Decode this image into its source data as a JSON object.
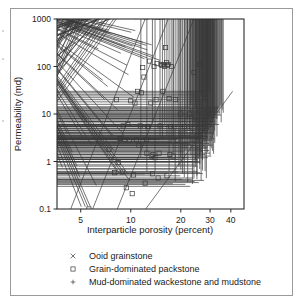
{
  "figure": {
    "background": "#ffffff",
    "frame_color": "#9a9a9a",
    "axis_color": "#2b2b2b",
    "marker_color": "#3a3a3a",
    "line_color": "#4a4a4a"
  },
  "chart_data": {
    "type": "scatter",
    "title": "",
    "subtitle": "",
    "xlabel": "Interparticle porosity (percent)",
    "ylabel": "Permeability (md)",
    "xscale": "log",
    "yscale": "log",
    "xlim": [
      3.6,
      48
    ],
    "ylim": [
      0.1,
      1000
    ],
    "xticks": [
      5,
      10,
      20,
      30,
      40
    ],
    "xticklabels": [
      "5",
      "10",
      "20",
      "30",
      "40"
    ],
    "yticks": [
      0.1,
      1,
      10,
      100,
      1000
    ],
    "yticklabels": [
      "0.1",
      "1",
      "10",
      "100",
      "1000"
    ],
    "grid": false,
    "legend_position": "below-axes",
    "legend": [
      {
        "marker": "x",
        "label": "Ooid grainstone"
      },
      {
        "marker": "square",
        "label": "Grain-dominated packstone"
      },
      {
        "marker": "plus",
        "label": "Mud-dominated wackestone and mudstone"
      }
    ],
    "series": [
      {
        "name": "Ooid grainstone",
        "marker": "x",
        "points": [
          [
            4.0,
            0.67
          ],
          [
            4.3,
            3.4
          ],
          [
            4.6,
            1.4
          ],
          [
            4.9,
            0.72
          ],
          [
            5.0,
            0.5
          ],
          [
            5.1,
            0.42
          ],
          [
            5.2,
            0.1
          ],
          [
            5.5,
            0.1
          ],
          [
            5.7,
            0.1
          ],
          [
            5.9,
            0.1
          ],
          [
            5.4,
            2.6
          ],
          [
            5.6,
            6.0
          ],
          [
            6.0,
            2.0
          ],
          [
            6.4,
            0.28
          ],
          [
            6.6,
            210
          ],
          [
            6.9,
            2.4
          ],
          [
            7.0,
            46
          ],
          [
            7.2,
            18
          ],
          [
            7.4,
            500
          ],
          [
            7.6,
            520
          ],
          [
            7.8,
            440
          ],
          [
            7.5,
            34
          ],
          [
            8.0,
            3.0
          ],
          [
            8.1,
            3.1
          ],
          [
            8.2,
            1.5
          ],
          [
            8.4,
            0.6
          ],
          [
            8.6,
            11
          ],
          [
            8.8,
            0.52
          ],
          [
            9.0,
            170
          ],
          [
            9.2,
            0.49
          ],
          [
            9.4,
            3.3
          ],
          [
            9.6,
            230
          ],
          [
            9.8,
            95
          ],
          [
            9.9,
            0.5
          ],
          [
            10.0,
            60
          ],
          [
            10.2,
            0.35
          ],
          [
            10.4,
            470
          ],
          [
            10.6,
            240
          ],
          [
            10.8,
            20
          ],
          [
            11.0,
            510
          ],
          [
            11.2,
            900
          ],
          [
            11.5,
            1000
          ],
          [
            11.8,
            1000
          ],
          [
            12.0,
            240
          ],
          [
            12.2,
            290
          ],
          [
            12.4,
            950
          ],
          [
            12.6,
            900
          ],
          [
            12.8,
            250
          ],
          [
            13.0,
            200
          ],
          [
            13.2,
            880
          ],
          [
            13.5,
            950
          ],
          [
            13.8,
            255
          ],
          [
            14.0,
            1000
          ],
          [
            14.2,
            900
          ],
          [
            14.5,
            950
          ],
          [
            15.0,
            900
          ],
          [
            15.5,
            870
          ],
          [
            16.0,
            900
          ],
          [
            16.5,
            880
          ],
          [
            12.5,
            130
          ],
          [
            13.0,
            135
          ],
          [
            14.0,
            150
          ],
          [
            15.5,
            120
          ]
        ]
      },
      {
        "name": "Grain-dominated packstone",
        "marker": "square",
        "points": [
          [
            5.6,
            0.1
          ],
          [
            7.4,
            1.8
          ],
          [
            8.0,
            0.58
          ],
          [
            8.2,
            20
          ],
          [
            8.4,
            0.95
          ],
          [
            8.6,
            3.0
          ],
          [
            8.7,
            3.1
          ],
          [
            8.9,
            0.6
          ],
          [
            9.0,
            5.6
          ],
          [
            9.2,
            2.9
          ],
          [
            9.4,
            0.28
          ],
          [
            9.6,
            6.0
          ],
          [
            9.8,
            2.8
          ],
          [
            10.0,
            19
          ],
          [
            10.2,
            0.21
          ],
          [
            10.4,
            0.52
          ],
          [
            10.6,
            17
          ],
          [
            10.8,
            2.9
          ],
          [
            11.0,
            30
          ],
          [
            11.2,
            2.2
          ],
          [
            11.4,
            5.6
          ],
          [
            11.6,
            28
          ],
          [
            11.8,
            95
          ],
          [
            12.0,
            60
          ],
          [
            12.2,
            0.35
          ],
          [
            12.4,
            2.9
          ],
          [
            12.6,
            5.4
          ],
          [
            12.8,
            5.5
          ],
          [
            13.0,
            130
          ],
          [
            13.2,
            17
          ],
          [
            13.4,
            1.3
          ],
          [
            13.6,
            1.4
          ],
          [
            13.8,
            100
          ],
          [
            14.0,
            1.2
          ],
          [
            14.2,
            20
          ],
          [
            14.4,
            115
          ],
          [
            14.6,
            0.45
          ],
          [
            14.8,
            1.5
          ],
          [
            15.0,
            5.6
          ],
          [
            15.2,
            110
          ],
          [
            15.4,
            105
          ],
          [
            15.6,
            30
          ],
          [
            15.8,
            110
          ],
          [
            16.0,
            100
          ],
          [
            16.2,
            250
          ],
          [
            16.4,
            120
          ],
          [
            16.6,
            105
          ],
          [
            16.8,
            110
          ],
          [
            17.0,
            21
          ],
          [
            17.2,
            1.4
          ],
          [
            17.4,
            5.5
          ],
          [
            17.6,
            100
          ],
          [
            18.0,
            1.3
          ],
          [
            18.4,
            5.4
          ],
          [
            18.6,
            20
          ],
          [
            19.0,
            2.8
          ],
          [
            20.0,
            10
          ],
          [
            21.0,
            5.4
          ],
          [
            22.5,
            10
          ],
          [
            24.0,
            75
          ],
          [
            26.0,
            110
          ],
          [
            12.5,
            1.5
          ],
          [
            13.5,
            0.55
          ],
          [
            16.5,
            0.5
          ]
        ]
      },
      {
        "name": "Mud-dominated wackestone and mudstone",
        "marker": "plus",
        "points": [
          [
            11.5,
            1.1
          ],
          [
            12.5,
            0.55
          ],
          [
            13.5,
            5.6
          ],
          [
            14.0,
            0.55
          ],
          [
            15.0,
            3.0
          ],
          [
            15.5,
            2.9
          ],
          [
            16.0,
            5.5
          ],
          [
            16.5,
            3.0
          ],
          [
            17.0,
            0.55
          ],
          [
            17.5,
            2.2
          ],
          [
            18.0,
            1.2
          ],
          [
            18.5,
            0.34
          ],
          [
            19.0,
            5.4
          ],
          [
            19.5,
            2.9
          ],
          [
            20.0,
            1.1
          ],
          [
            20.5,
            0.5
          ],
          [
            21.0,
            3.0
          ],
          [
            21.5,
            5.5
          ],
          [
            22.0,
            0.33
          ],
          [
            22.5,
            2.0
          ],
          [
            23.0,
            1.2
          ],
          [
            23.5,
            0.3
          ],
          [
            24.0,
            6.0
          ],
          [
            24.5,
            1.0
          ],
          [
            25.0,
            0.45
          ],
          [
            25.5,
            2.2
          ],
          [
            26.0,
            1.1
          ],
          [
            26.5,
            3.0
          ],
          [
            27.0,
            0.95
          ],
          [
            27.5,
            2.5
          ],
          [
            22.0,
            7.0
          ],
          [
            23.0,
            10
          ],
          [
            24.0,
            5.0
          ],
          [
            25.0,
            4.5
          ],
          [
            26.0,
            5.5
          ],
          [
            26.5,
            8.0
          ],
          [
            27.0,
            6.0
          ],
          [
            27.5,
            4.0
          ],
          [
            28.0,
            3.2
          ],
          [
            28.5,
            3.0
          ],
          [
            29.0,
            3.5
          ],
          [
            29.5,
            4.0
          ],
          [
            30.0,
            4.5
          ],
          [
            30.5,
            5.0
          ],
          [
            31.0,
            6.0
          ],
          [
            31.5,
            7.0
          ],
          [
            32.0,
            8.0
          ],
          [
            32.5,
            9.0
          ],
          [
            33.0,
            10
          ],
          [
            33.5,
            11
          ],
          [
            34.0,
            12
          ],
          [
            34.5,
            13
          ],
          [
            35.0,
            14
          ],
          [
            28.0,
            2.5
          ],
          [
            28.5,
            2.2
          ],
          [
            29.0,
            2.6
          ],
          [
            29.5,
            3.1
          ],
          [
            30.0,
            3.4
          ],
          [
            27.0,
            2.0
          ],
          [
            27.5,
            1.8
          ],
          [
            28.0,
            1.6
          ],
          [
            26.5,
            1.4
          ],
          [
            26.0,
            1.2
          ],
          [
            25.5,
            1.0
          ],
          [
            25.0,
            0.85
          ],
          [
            24.5,
            0.7
          ],
          [
            26.0,
            0.62
          ],
          [
            27.0,
            0.58
          ],
          [
            28.0,
            0.56
          ],
          [
            24.0,
            0.42
          ],
          [
            25.0,
            0.38
          ],
          [
            26.5,
            0.36
          ],
          [
            28.5,
            0.4
          ],
          [
            29.5,
            1.9
          ],
          [
            30.5,
            2.4
          ],
          [
            31.0,
            2.8
          ],
          [
            31.5,
            3.3
          ],
          [
            32.0,
            4.0
          ],
          [
            26.0,
            26
          ],
          [
            26.5,
            22
          ],
          [
            27.5,
            18
          ],
          [
            28.0,
            16
          ],
          [
            24.5,
            12
          ],
          [
            25.0,
            9.0
          ],
          [
            29.0,
            20
          ],
          [
            30.0,
            24
          ],
          [
            33.0,
            7.0
          ],
          [
            34.0,
            8.5
          ],
          [
            35.5,
            11
          ],
          [
            36.0,
            9.5
          ],
          [
            23.5,
            3.5
          ],
          [
            22.5,
            4.2
          ],
          [
            21.5,
            1.6
          ],
          [
            20.0,
            0.6
          ],
          [
            21.0,
            0.42
          ],
          [
            19.5,
            0.7
          ],
          [
            18.0,
            2.6
          ],
          [
            29.0,
            5.5
          ],
          [
            29.5,
            6.5
          ],
          [
            30.0,
            2.0
          ],
          [
            30.5,
            1.7
          ],
          [
            31.0,
            1.5
          ],
          [
            28.0,
            4.8
          ],
          [
            28.5,
            5.6
          ],
          [
            29.0,
            7.5
          ],
          [
            27.0,
            3.8
          ],
          [
            27.5,
            3.4
          ],
          [
            26.0,
            3.6
          ],
          [
            25.5,
            3.2
          ],
          [
            25.0,
            2.6
          ],
          [
            24.0,
            2.3
          ],
          [
            23.0,
            2.4
          ],
          [
            32.0,
            2.2
          ],
          [
            33.0,
            3.0
          ],
          [
            30.0,
            8.0
          ],
          [
            31.0,
            10
          ],
          [
            32.5,
            5.5
          ],
          [
            29.0,
            1.4
          ],
          [
            30.0,
            1.2
          ],
          [
            31.5,
            1.3
          ],
          [
            22.0,
            12
          ],
          [
            23.0,
            14
          ],
          [
            28.5,
            28
          ],
          [
            29.5,
            30
          ],
          [
            27.0,
            1.0
          ],
          [
            26.0,
            0.8
          ],
          [
            35.0,
            6.0
          ]
        ]
      }
    ],
    "trend_lines": [
      {
        "name": "trend-line-1",
        "x1": 4.35,
        "y1": 0.1,
        "x2": 12.2,
        "y2": 1000
      },
      {
        "name": "trend-line-2",
        "x1": 5.9,
        "y1": 0.1,
        "x2": 16.8,
        "y2": 1000
      },
      {
        "name": "trend-line-3",
        "x1": 8.3,
        "y1": 0.1,
        "x2": 24.0,
        "y2": 1000
      },
      {
        "name": "trend-line-4",
        "x1": 12.3,
        "y1": 0.1,
        "x2": 41.0,
        "y2": 30
      }
    ]
  }
}
